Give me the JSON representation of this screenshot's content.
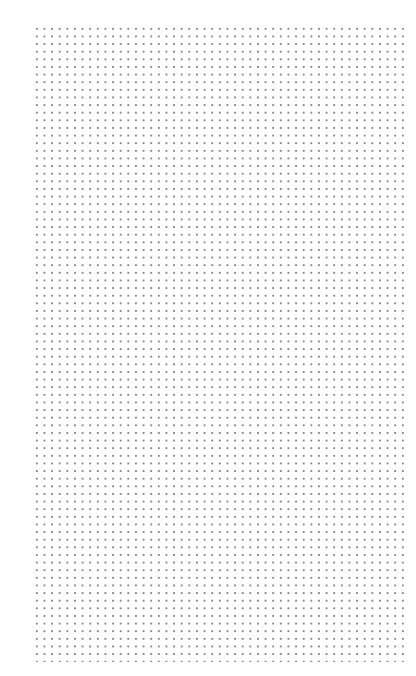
{
  "page": {
    "type": "dotted-grid-paper",
    "background_color": "#ffffff",
    "dot_color": "#8a8a8a"
  },
  "grid": {
    "columns": 49,
    "rows": 84,
    "spacing_px": 7.63
  }
}
